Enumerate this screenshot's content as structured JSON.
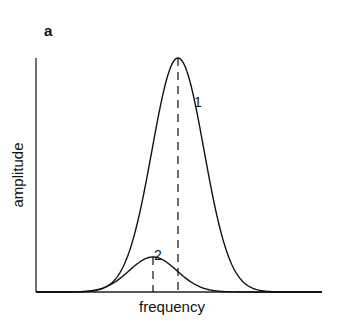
{
  "panel_label": "a",
  "chart_data": {
    "type": "line",
    "title": "",
    "xlabel": "frequency",
    "ylabel": "amplitude",
    "grid": false,
    "legend": "none",
    "ticks": "none",
    "series": [
      {
        "name": "1",
        "shape": "gaussian",
        "peak_x_px": 178,
        "peak_y_px": 58,
        "sigma_px": 26,
        "annotation": "1"
      },
      {
        "name": "2",
        "shape": "gaussian",
        "peak_x_px": 153,
        "peak_y_px": 257,
        "sigma_px": 24,
        "annotation": "2"
      }
    ],
    "markers": [
      {
        "type": "dashed-vertical",
        "x_px": 178,
        "series": "1"
      },
      {
        "type": "dashed-vertical",
        "x_px": 153,
        "series": "2"
      }
    ],
    "axes_px": {
      "x0": 36,
      "x1": 322,
      "y_top": 58,
      "y_base": 292
    }
  }
}
